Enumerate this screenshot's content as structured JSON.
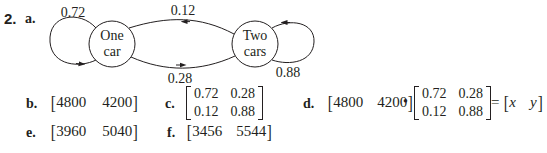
{
  "problem": {
    "number": "2.",
    "part_a": {
      "label": "a.",
      "diagram": {
        "states": [
          {
            "id": "one",
            "line1": "One",
            "line2": "car"
          },
          {
            "id": "two",
            "line1": "Two",
            "line2": "cars"
          }
        ],
        "transitions": [
          {
            "from": "one",
            "to": "one",
            "prob": "0.72"
          },
          {
            "from": "two",
            "to": "one",
            "prob": "0.12"
          },
          {
            "from": "one",
            "to": "two",
            "prob": "0.28"
          },
          {
            "from": "two",
            "to": "two",
            "prob": "0.88"
          }
        ]
      }
    },
    "part_b": {
      "label": "b.",
      "vector": [
        "4800",
        "4200"
      ]
    },
    "part_c": {
      "label": "c.",
      "matrix": [
        [
          "0.72",
          "0.28"
        ],
        [
          "0.12",
          "0.88"
        ]
      ]
    },
    "part_d": {
      "label": "d.",
      "vector": [
        "4800",
        "4200"
      ],
      "operator": "•",
      "matrix": [
        [
          "0.72",
          "0.28"
        ],
        [
          "0.12",
          "0.88"
        ]
      ],
      "equals": "=",
      "result": [
        "x",
        "y"
      ]
    },
    "part_e": {
      "label": "e.",
      "vector": [
        "3960",
        "5040"
      ]
    },
    "part_f": {
      "label": "f.",
      "vector": [
        "3456",
        "5544"
      ]
    }
  }
}
